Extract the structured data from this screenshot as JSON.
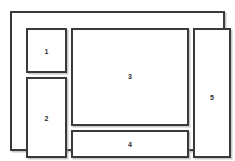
{
  "diagram": {
    "type": "layout-wireframe",
    "title": "",
    "canvas": {
      "width": 235,
      "height": 161,
      "background": "#ffffff"
    },
    "style": {
      "line_color": "#3a3a3a",
      "fill_color": "#ffffff",
      "shadow_color": "#969696",
      "line_width_px": 2
    },
    "outer_frame": {
      "label": "",
      "x": 10,
      "y": 11,
      "width": 215,
      "height": 140
    },
    "regions": [
      {
        "id": "region-1",
        "label": "1",
        "x": 14,
        "y": 15,
        "width": 41,
        "height": 45,
        "column": "left",
        "row": "top"
      },
      {
        "id": "region-2",
        "label": "2",
        "x": 14,
        "y": 64,
        "width": 41,
        "height": 81,
        "column": "left",
        "row": "bottom"
      },
      {
        "id": "region-3",
        "label": "3",
        "x": 59,
        "y": 15,
        "width": 118,
        "height": 98,
        "column": "center",
        "row": "top"
      },
      {
        "id": "region-4",
        "label": "4",
        "x": 59,
        "y": 117,
        "width": 118,
        "height": 28,
        "column": "center",
        "row": "bottom"
      },
      {
        "id": "region-5",
        "label": "5",
        "x": 181,
        "y": 15,
        "width": 38,
        "height": 130,
        "column": "right",
        "row": "full"
      }
    ]
  }
}
